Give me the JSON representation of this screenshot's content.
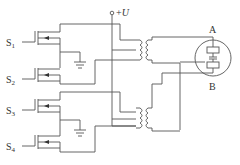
{
  "diagram": {
    "type": "circuit-schematic",
    "supply": {
      "label": "+U",
      "prefix": "+",
      "symbol": "U"
    },
    "switches": [
      {
        "name": "S",
        "index": "1"
      },
      {
        "name": "S",
        "index": "2"
      },
      {
        "name": "S",
        "index": "3"
      },
      {
        "name": "S",
        "index": "4"
      }
    ],
    "load": {
      "terminal_top": "A",
      "terminal_bottom": "B"
    },
    "transformers": 2,
    "grounds": 2
  }
}
